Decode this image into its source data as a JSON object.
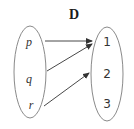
{
  "diagram": {
    "title": "D",
    "domain": {
      "labels": [
        "p",
        "q",
        "r"
      ]
    },
    "codomain": {
      "labels": [
        "1",
        "2",
        "3"
      ]
    },
    "mappings": [
      {
        "from": "p",
        "to": "1"
      },
      {
        "from": "q",
        "to": "1"
      },
      {
        "from": "r",
        "to": "2"
      }
    ],
    "colors": {
      "ellipse_stroke": "#8a8a8a",
      "arrow": "#333333",
      "text": "#333333"
    }
  }
}
